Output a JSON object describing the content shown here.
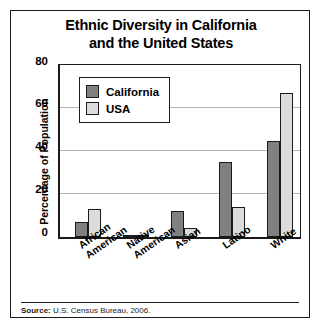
{
  "chart_data": {
    "type": "bar",
    "title": "Ethnic Diversity in California and the United States",
    "title_lines": [
      "Ethnic Diversity in California",
      "and the United States"
    ],
    "xlabel": "",
    "ylabel": "Percentage of Population",
    "ylim": [
      0,
      80
    ],
    "ytick_labels": [
      "0",
      "20",
      "40",
      "60",
      "80"
    ],
    "ytick_values": [
      0,
      20,
      40,
      60,
      80
    ],
    "grid": true,
    "legend_position": "upper left",
    "categories": [
      "African American",
      "Native American",
      "Asian",
      "Latino",
      "White"
    ],
    "category_lines": [
      [
        "African",
        "American"
      ],
      [
        "Native",
        "American"
      ],
      [
        "Asian"
      ],
      [
        "Latino"
      ],
      [
        "White"
      ]
    ],
    "series": [
      {
        "name": "California",
        "color": "#808080",
        "values": [
          7,
          1,
          12,
          35,
          45
        ]
      },
      {
        "name": "USA",
        "color": "#dcdcdc",
        "values": [
          13,
          1,
          4,
          14,
          67
        ]
      }
    ],
    "source_label": "Source:",
    "source_text": "U.S. Census Bureau, 2006."
  },
  "colors": {
    "california": "#808080",
    "usa": "#dcdcdc",
    "outline": "#1a1a1a",
    "gridline": "#b4b4b4",
    "background": "#ffffff"
  }
}
